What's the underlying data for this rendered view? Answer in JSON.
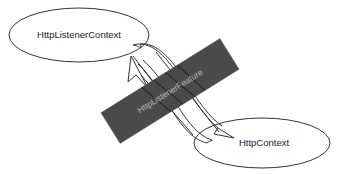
{
  "diagram": {
    "nodes": [
      {
        "id": "listener",
        "label": "HttpListenerContext"
      },
      {
        "id": "context",
        "label": "HttpContext"
      }
    ],
    "bridge": {
      "label": "HttpListenerFeature"
    },
    "edges": [
      {
        "from": "listener",
        "to": "context",
        "style": "arrow"
      },
      {
        "from": "context",
        "to": "listener",
        "style": "arrow"
      }
    ],
    "colors": {
      "background": "#ffffff",
      "stroke": "#333333",
      "bridge_fill": "#4a4a4a",
      "bridge_text": "#b8b8b8"
    }
  }
}
